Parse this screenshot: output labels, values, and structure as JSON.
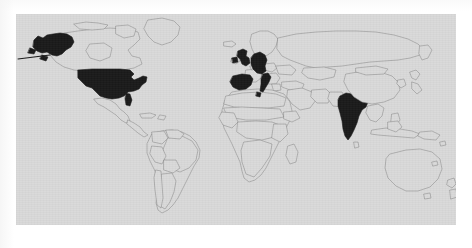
{
  "figure": {
    "kind": "world-choropleth-map",
    "title": "",
    "caption": "",
    "background_color": "#ffffff",
    "map_background_color": "#d9d9d9",
    "border_color": "#8a8a8a",
    "highlight_color": "#1a1a1a",
    "projection": "equirectangular",
    "frame": {
      "x": 16,
      "y": 14,
      "width": 440,
      "height": 211
    }
  },
  "legend": {
    "visible": false,
    "entries": []
  },
  "chart_data": {
    "type": "map",
    "title": "",
    "xlabel": "",
    "ylabel": "",
    "projection": "equirectangular",
    "lon_range": [
      -180,
      180
    ],
    "lat_range": [
      -60,
      84
    ],
    "grid": false,
    "legend_position": "none",
    "value_encoding": "binary-highlight",
    "colors": {
      "highlighted": "#1a1a1a",
      "not_highlighted": "#d9d9d9",
      "border": "#8a8a8a",
      "ocean": "#d9d9d9"
    },
    "highlighted_regions": [
      {
        "name": "United States of America",
        "code": "USA",
        "value": 1
      },
      {
        "name": "Alaska (United States)",
        "code": "US-AK",
        "value": 1
      },
      {
        "name": "United Kingdom",
        "code": "GBR",
        "value": 1
      },
      {
        "name": "Germany",
        "code": "DEU",
        "value": 1
      },
      {
        "name": "Spain",
        "code": "ESP",
        "value": 1
      },
      {
        "name": "Italy",
        "code": "ITA",
        "value": 1
      },
      {
        "name": "India",
        "code": "IND",
        "value": 1
      }
    ],
    "unhighlighted_regions": [
      {
        "name": "Canada",
        "code": "CAN",
        "value": 0
      },
      {
        "name": "Mexico",
        "code": "MEX",
        "value": 0
      },
      {
        "name": "Brazil",
        "code": "BRA",
        "value": 0
      },
      {
        "name": "Argentina",
        "code": "ARG",
        "value": 0
      },
      {
        "name": "France",
        "code": "FRA",
        "value": 0
      },
      {
        "name": "Russia",
        "code": "RUS",
        "value": 0
      },
      {
        "name": "China",
        "code": "CHN",
        "value": 0
      },
      {
        "name": "Japan",
        "code": "JPN",
        "value": 0
      },
      {
        "name": "Australia",
        "code": "AUS",
        "value": 0
      },
      {
        "name": "New Zealand",
        "code": "NZL",
        "value": 0
      },
      {
        "name": "South Africa",
        "code": "ZAF",
        "value": 0
      },
      {
        "name": "Greenland",
        "code": "GRL",
        "value": 0
      }
    ]
  }
}
